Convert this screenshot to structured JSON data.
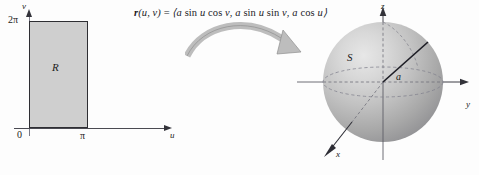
{
  "figure": {
    "background_color": "#fdfdfd"
  },
  "formula": {
    "text": "r(u, v) = ⟨a sin u cos v, a sin u sin v, a cos u⟩",
    "vector_name": "r",
    "components": [
      "a sin u cos v",
      "a sin u sin v",
      "a cos u"
    ],
    "parameters": [
      "u",
      "v"
    ]
  },
  "uv_panel": {
    "region_label": "R",
    "region_fill_color": "#cfcfcf",
    "region_border_color": "#2e2e33",
    "axes": {
      "horizontal": {
        "label": "u",
        "origin_label": "0"
      },
      "vertical": {
        "label": "v"
      }
    },
    "ticks": {
      "u_max": "π",
      "v_max": "2π",
      "origin": "0"
    },
    "domain": {
      "u_range": [
        0,
        "π"
      ],
      "v_range": [
        0,
        "2π"
      ]
    }
  },
  "mapping_arrow": {
    "name": "curved-mapping-arrow",
    "color": "#b9b9b9",
    "direction": "left-to-right-curving-down"
  },
  "sphere_panel": {
    "surface_label": "S",
    "radius_label": "a",
    "axes": [
      {
        "name": "z",
        "label": "z",
        "direction": "up"
      },
      {
        "name": "y",
        "label": "y",
        "direction": "right"
      },
      {
        "name": "x",
        "label": "x",
        "direction": "down-left"
      }
    ],
    "sphere_fill_highlight": "#e7e7e7",
    "sphere_fill_shadow": "#848489",
    "hidden_line_style": "dashed"
  }
}
